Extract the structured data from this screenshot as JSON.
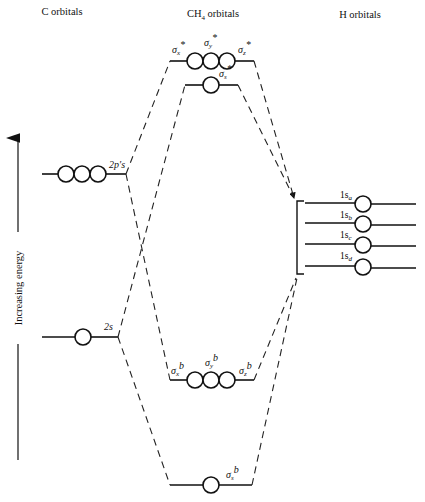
{
  "headers": {
    "c_orbitals": "C orbitals",
    "ch4_orbitals": "CH",
    "ch4_subscript": "4",
    "ch4_suffix": " orbitals",
    "h_orbitals": "H orbitals"
  },
  "axis": {
    "label": "Increasing energy",
    "direction": "up"
  },
  "carbon": {
    "p_level_label": "2p′s",
    "s_level_label": "2s"
  },
  "ch4": {
    "antibonding_p": {
      "x": "σ",
      "x_sub": "x",
      "x_sup": "*",
      "y": "σ",
      "y_sub": "y",
      "y_sup": "*",
      "z": "σ",
      "z_sub": "z",
      "z_sup": "*"
    },
    "antibonding_s": {
      "sym": "σ",
      "sub": "s",
      "sup": "*"
    },
    "bonding_p": {
      "x": "σ",
      "x_sub": "x",
      "x_sup": "b",
      "y": "σ",
      "y_sub": "y",
      "y_sup": "b",
      "z": "σ",
      "z_sub": "z",
      "z_sup": "b"
    },
    "bonding_s": {
      "sym": "σ",
      "sub": "s",
      "sup": "b"
    }
  },
  "hydrogen": {
    "levels": [
      {
        "prefix": "1s",
        "sub": "a"
      },
      {
        "prefix": "1s",
        "sub": "b"
      },
      {
        "prefix": "1s",
        "sub": "c"
      },
      {
        "prefix": "1s",
        "sub": "d"
      }
    ]
  },
  "caption": {
    "visible": "partially cut off, illegible"
  }
}
